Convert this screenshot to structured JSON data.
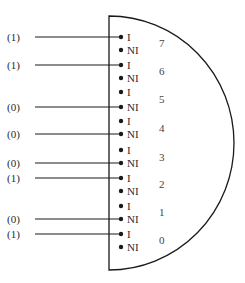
{
  "diagram": {
    "type": "multiplexer-select-pins",
    "body": {
      "x": 109,
      "top": 16,
      "bottom": 270,
      "right": 234
    },
    "pins": [
      {
        "number": "7",
        "i_label": "I",
        "ni_label": "NI",
        "i_y": 37,
        "ni_y": 50,
        "num_y": 47,
        "input": "(1)",
        "connected": "I"
      },
      {
        "number": "6",
        "i_label": "I",
        "ni_label": "NI",
        "i_y": 65,
        "ni_y": 78,
        "num_y": 75,
        "input": "(1)",
        "connected": "I"
      },
      {
        "number": "5",
        "i_label": "I",
        "ni_label": "NI",
        "i_y": 92,
        "ni_y": 107,
        "num_y": 103,
        "input": "(0)",
        "connected": "NI"
      },
      {
        "number": "4",
        "i_label": "I",
        "ni_label": "NI",
        "i_y": 121,
        "ni_y": 134,
        "num_y": 132,
        "input": "(0)",
        "connected": "NI"
      },
      {
        "number": "3",
        "i_label": "I",
        "ni_label": "NI",
        "i_y": 150,
        "ni_y": 163,
        "num_y": 161,
        "input": "(0)",
        "connected": "NI"
      },
      {
        "number": "2",
        "i_label": "I",
        "ni_label": "NI",
        "i_y": 178,
        "ni_y": 191,
        "num_y": 188,
        "input": "(1)",
        "connected": "I"
      },
      {
        "number": "1",
        "i_label": "I",
        "ni_label": "NI",
        "i_y": 206,
        "ni_y": 219,
        "num_y": 216,
        "input": "(0)",
        "connected": "NI"
      },
      {
        "number": "0",
        "i_label": "I",
        "ni_label": "NI",
        "i_y": 234,
        "ni_y": 247,
        "num_y": 244,
        "input": "(1)",
        "connected": "I"
      }
    ],
    "colors": {
      "line": "#1a1a1a",
      "text": "#2a2a2a"
    }
  }
}
